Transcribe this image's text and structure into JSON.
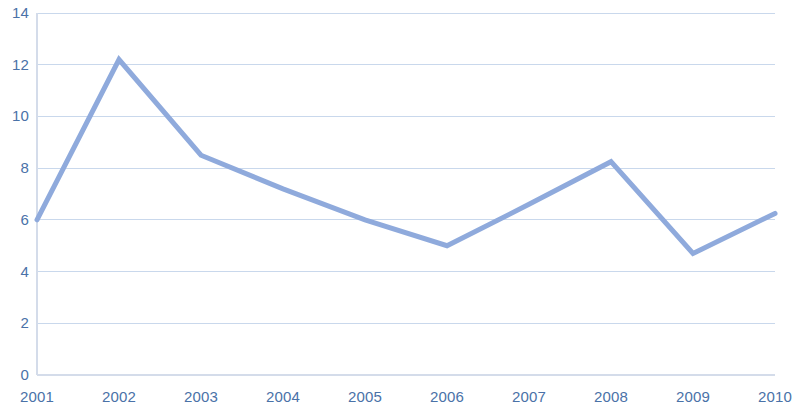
{
  "chart_data": {
    "type": "line",
    "title": "",
    "subtitle": "",
    "xlabel": "",
    "ylabel": "",
    "categories": [
      "2001",
      "2002",
      "2003",
      "2004",
      "2005",
      "2006",
      "2007",
      "2008",
      "2009",
      "2010"
    ],
    "values": [
      6.0,
      12.2,
      8.5,
      7.2,
      6.0,
      5.0,
      6.6,
      8.25,
      4.7,
      6.25
    ],
    "series": [
      {
        "name": "",
        "values": [
          6.0,
          12.2,
          8.5,
          7.2,
          6.0,
          5.0,
          6.6,
          8.25,
          4.7,
          6.25
        ],
        "color": "#8faadc"
      }
    ],
    "ylim": [
      0,
      14
    ],
    "xlim": [
      0,
      9
    ],
    "y_ticks": [
      0,
      2,
      4,
      6,
      8,
      10,
      12,
      14
    ],
    "y_tick_labels": [
      "0",
      "2",
      "4",
      "6",
      "8",
      "10",
      "12",
      "14"
    ],
    "x_tick_labels": [
      "2001",
      "2002",
      "2003",
      "2004",
      "2005",
      "2006",
      "2007",
      "2008",
      "2009",
      "2010"
    ],
    "grid": "horizontal",
    "grid_color": "#c9d8ec",
    "axis_color": "#d4dcea",
    "tick_label_color": "#4a72a8",
    "legend": "none",
    "legend_position": "none",
    "markers": "none",
    "line_width": 5,
    "background_color": "#ffffff",
    "annotations": []
  },
  "plot_geometry": {
    "left": 37,
    "right": 775,
    "top": 13,
    "bottom": 375
  }
}
